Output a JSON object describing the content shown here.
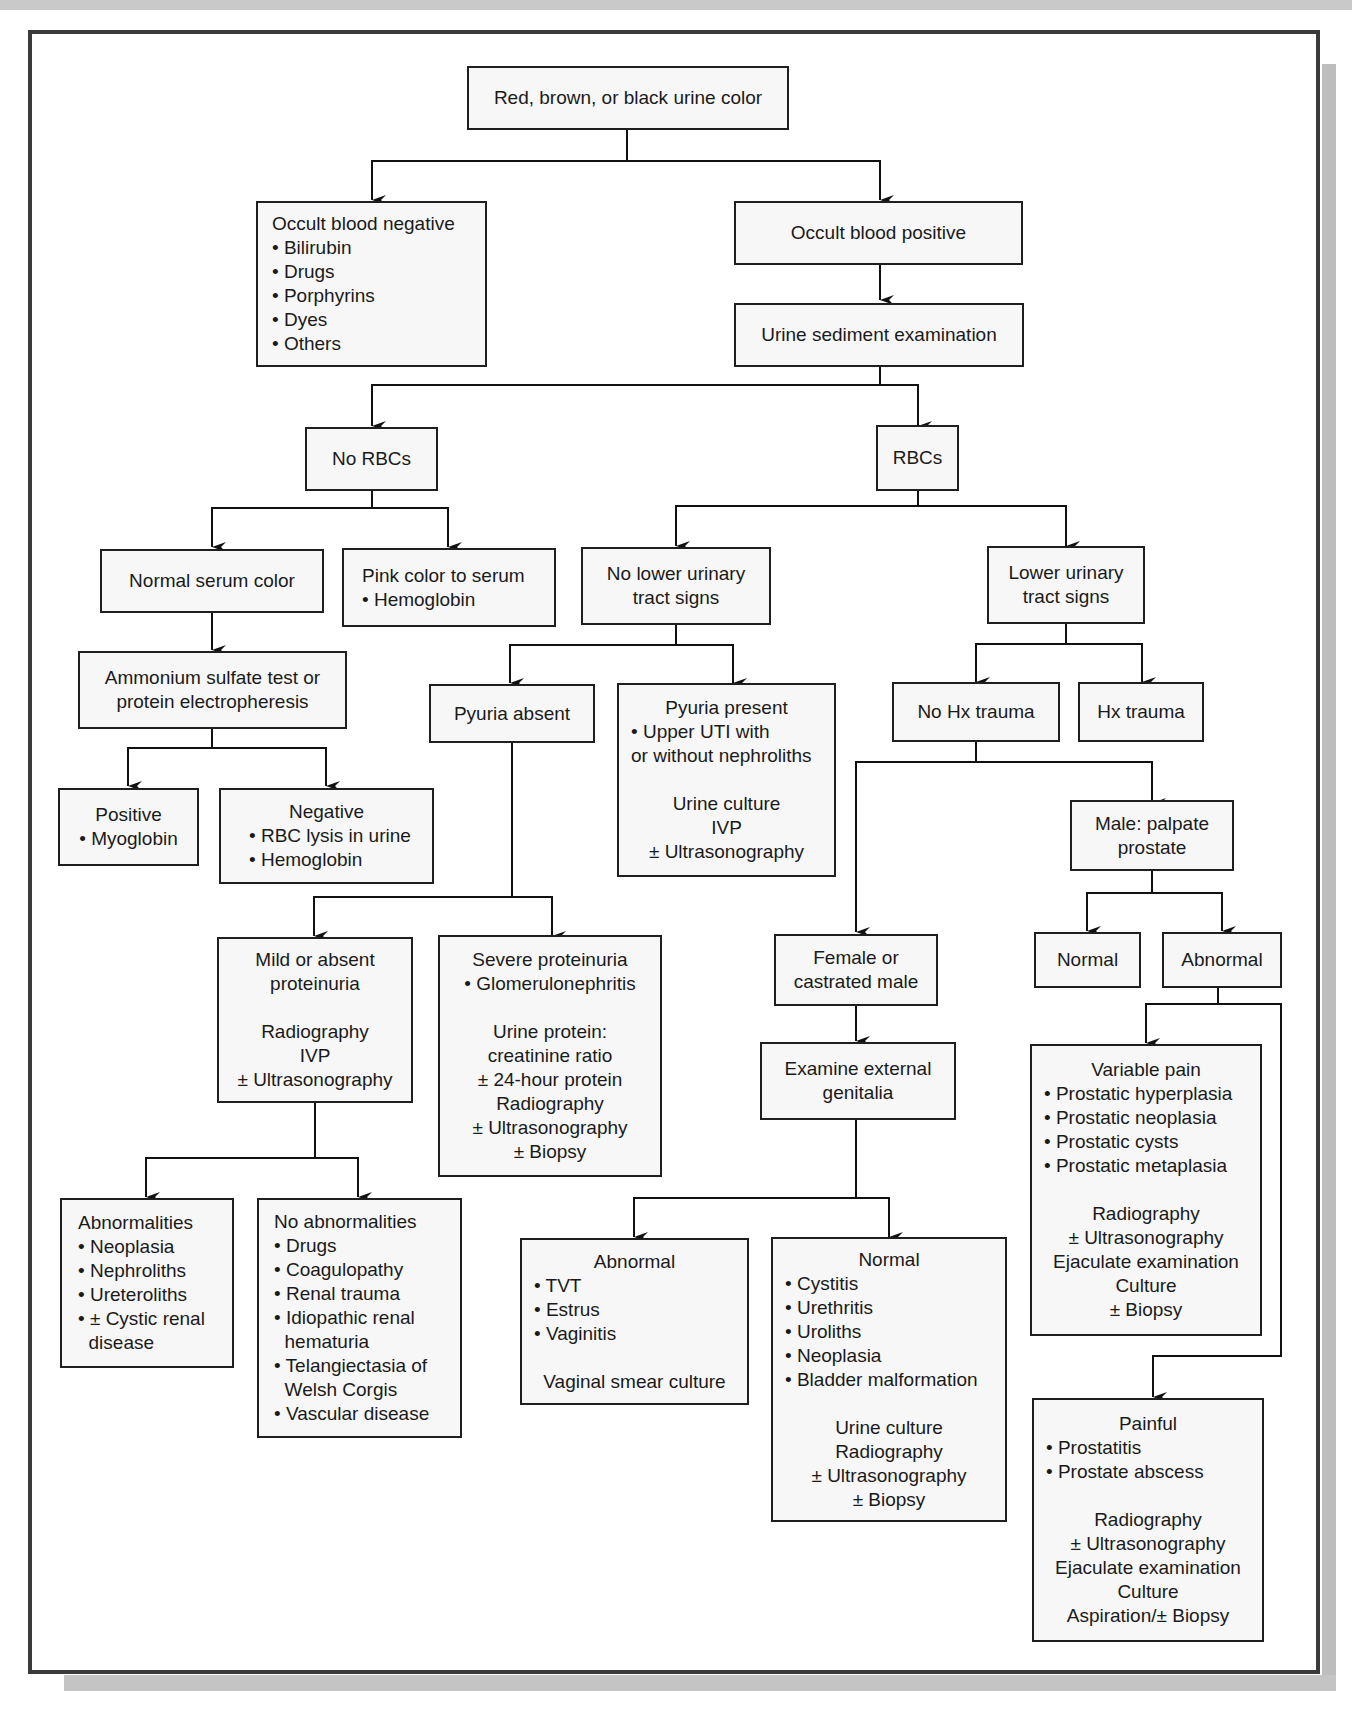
{
  "diagram": {
    "title": "Red, brown, or black urine color",
    "colors": {
      "frame": "#3a3a3a",
      "box_border": "#1f1f1f",
      "box_fill": "#f7f7f7",
      "shadow": "#bdbdbd"
    },
    "nodes": {
      "root": {
        "lines": [
          "Red, brown, or black urine color"
        ]
      },
      "occult_neg": {
        "lines": [
          "Occult blood negative",
          "• Bilirubin",
          "• Drugs",
          "• Porphyrins",
          "• Dyes",
          "• Others"
        ]
      },
      "occult_pos": {
        "lines": [
          "Occult blood positive"
        ]
      },
      "sediment": {
        "lines": [
          "Urine sediment examination"
        ]
      },
      "no_rbcs": {
        "lines": [
          "No RBCs"
        ]
      },
      "rbcs": {
        "lines": [
          "RBCs"
        ]
      },
      "normal_serum": {
        "lines": [
          "Normal serum color"
        ]
      },
      "pink_serum": {
        "lines": [
          "Pink color to serum",
          "• Hemoglobin"
        ]
      },
      "ammonium": {
        "lines": [
          "Ammonium sulfate test or",
          "protein electropheresis"
        ]
      },
      "positive": {
        "lines": [
          "Positive",
          "• Myoglobin"
        ]
      },
      "negative": {
        "lines": [
          "Negative",
          "• RBC lysis in urine",
          "• Hemoglobin"
        ]
      },
      "no_lower": {
        "lines": [
          "No lower urinary",
          "tract signs"
        ]
      },
      "lower": {
        "lines": [
          "Lower urinary",
          "tract signs"
        ]
      },
      "pyuria_absent": {
        "lines": [
          "Pyuria absent"
        ]
      },
      "pyuria_present": {
        "lines": [
          "Pyuria present",
          "• Upper UTI with",
          "or without nephroliths",
          "",
          "Urine culture",
          "IVP",
          "± Ultrasonography"
        ]
      },
      "no_hx": {
        "lines": [
          "No Hx trauma"
        ]
      },
      "hx": {
        "lines": [
          "Hx trauma"
        ]
      },
      "male_palpate": {
        "lines": [
          "Male: palpate",
          "prostate"
        ]
      },
      "mild": {
        "lines": [
          "Mild or absent",
          "proteinuria",
          "",
          "Radiography",
          "IVP",
          "± Ultrasonography"
        ]
      },
      "severe": {
        "lines": [
          "Severe proteinuria",
          "• Glomerulonephritis",
          "",
          "Urine protein:",
          "creatinine ratio",
          "± 24-hour protein",
          "Radiography",
          "± Ultrasonography",
          "± Biopsy"
        ]
      },
      "female": {
        "lines": [
          "Female or",
          "castrated male"
        ]
      },
      "prostate_normal": {
        "lines": [
          "Normal"
        ]
      },
      "prostate_abnormal": {
        "lines": [
          "Abnormal"
        ]
      },
      "examine": {
        "lines": [
          "Examine external",
          "genitalia"
        ]
      },
      "variable_pain": {
        "lines": [
          "Variable pain",
          "• Prostatic hyperplasia",
          "• Prostatic neoplasia",
          "• Prostatic cysts",
          "• Prostatic metaplasia",
          "",
          "Radiography",
          "± Ultrasonography",
          "Ejaculate examination",
          "Culture",
          "± Biopsy"
        ]
      },
      "abnormalities": {
        "lines": [
          "Abnormalities",
          "• Neoplasia",
          "• Nephroliths",
          "• Ureteroliths",
          "• ± Cystic renal",
          "  disease"
        ]
      },
      "no_abnormalities": {
        "lines": [
          "No abnormalities",
          "• Drugs",
          "• Coagulopathy",
          "• Renal trauma",
          "• Idiopathic renal",
          "  hematuria",
          "• Telangiectasia of",
          "  Welsh Corgis",
          "• Vascular disease"
        ]
      },
      "genital_abnormal": {
        "lines": [
          "Abnormal",
          "• TVT",
          "• Estrus",
          "• Vaginitis",
          "",
          "Vaginal smear culture"
        ]
      },
      "genital_normal": {
        "lines": [
          "Normal",
          "• Cystitis",
          "• Urethritis",
          "• Uroliths",
          "• Neoplasia",
          "• Bladder malformation",
          "",
          "Urine culture",
          "Radiography",
          "± Ultrasonography",
          "± Biopsy"
        ]
      },
      "painful": {
        "lines": [
          "Painful",
          "• Prostatitis",
          "• Prostate abscess",
          "",
          "Radiography",
          "± Ultrasonography",
          "Ejaculate examination",
          "Culture",
          "Aspiration/± Biopsy"
        ]
      }
    }
  }
}
